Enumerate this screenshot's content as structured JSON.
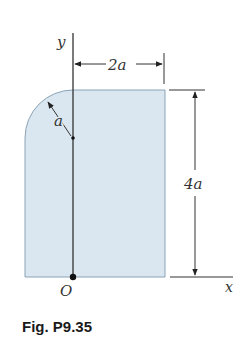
{
  "figure": {
    "caption": "Fig. P9.35",
    "labels": {
      "y_axis": "y",
      "x_axis": "x",
      "origin": "O",
      "width_dim": "2a",
      "height_dim": "4a",
      "radius": "a"
    },
    "colors": {
      "fill": "#dbe7f0",
      "stroke": "#7f9bb0",
      "line": "#222222"
    }
  }
}
